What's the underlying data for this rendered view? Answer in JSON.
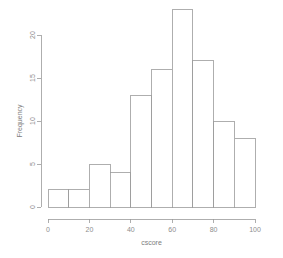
{
  "chart_data": {
    "type": "bar",
    "title": "",
    "subtitle": "",
    "xlabel": "cscore",
    "ylabel": "Frequency",
    "categories": [
      "0-10",
      "10-20",
      "20-30",
      "30-40",
      "40-50",
      "50-60",
      "60-70",
      "70-80",
      "80-90",
      "90-100"
    ],
    "bin_edges": [
      0,
      10,
      20,
      30,
      40,
      50,
      60,
      70,
      80,
      90,
      100
    ],
    "values": [
      2,
      2,
      5,
      4,
      13,
      16,
      23,
      17,
      10,
      8
    ],
    "bin_width": 10,
    "xlim": [
      0,
      100
    ],
    "ylim": [
      0,
      23
    ],
    "x_ticks": [
      0,
      20,
      40,
      60,
      80,
      100
    ],
    "x_tick_labels": [
      "0",
      "20",
      "40",
      "60",
      "80",
      "100"
    ],
    "y_ticks": [
      0,
      5,
      10,
      15,
      20
    ],
    "y_tick_labels": [
      "0",
      "5",
      "10",
      "15",
      "20"
    ],
    "grid": false,
    "legend": false,
    "legend_position": "none",
    "bar_fill_color": "#ffffff",
    "bar_stroke_color": "#9a9a9a",
    "axis_color": "#9a9a9a",
    "text_color": "#8d8d8d",
    "background_color": "#ffffff"
  }
}
